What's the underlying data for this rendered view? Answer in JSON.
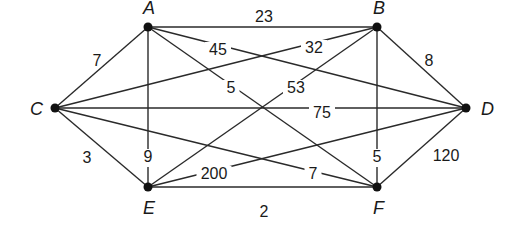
{
  "graph": {
    "type": "weighted-undirected-graph",
    "nodes": [
      {
        "id": "A",
        "label": "A",
        "x": 148,
        "y": 27,
        "lx": 143,
        "ly": 14
      },
      {
        "id": "B",
        "label": "B",
        "x": 377,
        "y": 27,
        "lx": 373,
        "ly": 14
      },
      {
        "id": "C",
        "label": "C",
        "x": 55,
        "y": 108,
        "lx": 30,
        "ly": 115
      },
      {
        "id": "D",
        "label": "D",
        "x": 466,
        "y": 108,
        "lx": 481,
        "ly": 115
      },
      {
        "id": "E",
        "label": "E",
        "x": 148,
        "y": 187,
        "lx": 143,
        "ly": 214
      },
      {
        "id": "F",
        "label": "F",
        "x": 377,
        "y": 187,
        "lx": 373,
        "ly": 214
      }
    ],
    "edges": [
      {
        "from": "A",
        "to": "B",
        "weight": "23",
        "lx": 264,
        "ly": 18,
        "bg": false
      },
      {
        "from": "A",
        "to": "C",
        "weight": "7",
        "lx": 97,
        "ly": 62,
        "bg": false
      },
      {
        "from": "A",
        "to": "E",
        "weight": "9",
        "lx": 148,
        "ly": 158,
        "bg": true
      },
      {
        "from": "A",
        "to": "D",
        "weight": "45",
        "lx": 218,
        "ly": 51,
        "bg": true
      },
      {
        "from": "A",
        "to": "F",
        "weight": "5",
        "lx": 231,
        "ly": 89,
        "bg": true
      },
      {
        "from": "B",
        "to": "C",
        "weight": "32",
        "lx": 314,
        "ly": 49,
        "bg": true
      },
      {
        "from": "B",
        "to": "D",
        "weight": "8",
        "lx": 429,
        "ly": 62,
        "bg": false
      },
      {
        "from": "B",
        "to": "E",
        "weight": "53",
        "lx": 296,
        "ly": 89,
        "bg": true
      },
      {
        "from": "B",
        "to": "F",
        "weight": "5",
        "lx": 377,
        "ly": 158,
        "bg": true
      },
      {
        "from": "C",
        "to": "D",
        "weight": "75",
        "lx": 322,
        "ly": 114,
        "bg": true
      },
      {
        "from": "C",
        "to": "E",
        "weight": "3",
        "lx": 87,
        "ly": 159,
        "bg": false
      },
      {
        "from": "C",
        "to": "F",
        "weight": "7",
        "lx": 313,
        "ly": 175,
        "bg": true
      },
      {
        "from": "D",
        "to": "E",
        "weight": "200",
        "lx": 214,
        "ly": 175,
        "bg": true
      },
      {
        "from": "D",
        "to": "F",
        "weight": "120",
        "lx": 446,
        "ly": 157,
        "bg": false
      },
      {
        "from": "E",
        "to": "F",
        "weight": "2",
        "lx": 264,
        "ly": 213,
        "bg": false
      }
    ]
  }
}
